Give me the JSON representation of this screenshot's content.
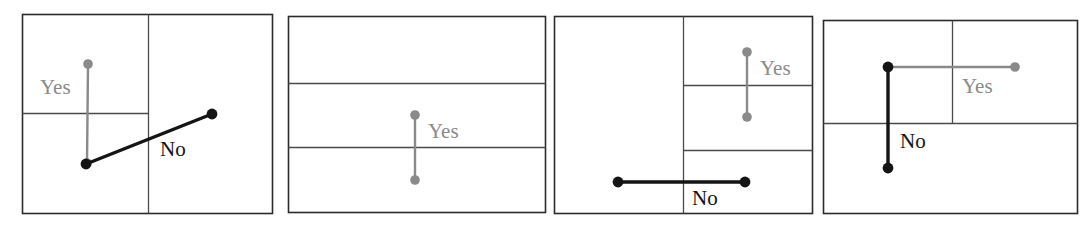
{
  "figure": {
    "width": 1084,
    "height": 235,
    "background_color": "#ffffff",
    "colors": {
      "panel_border": "#2b2b2b",
      "divider": "#4a4a4a",
      "yes_segment": "#8a8a8a",
      "no_segment": "#141414",
      "label_yes_text": "#8a8a8a",
      "label_no_text": "#141414"
    },
    "panels": [
      {
        "id": "panel-1",
        "index": 1,
        "frame": {
          "x": 22,
          "y": 14,
          "width": 250,
          "height": 199
        },
        "dividers": [
          {
            "orientation": "vertical",
            "x": 148,
            "y1": 14,
            "y2": 213
          },
          {
            "orientation": "horizontal",
            "y": 113,
            "x1": 22,
            "x2": 148
          }
        ],
        "segments": [
          {
            "name": "yes-segment",
            "label": "Yes",
            "color": "#8a8a8a",
            "start": {
              "x": 88,
              "y": 64,
              "endpoint": "dot"
            },
            "end": {
              "x": 87,
              "y": 163,
              "endpoint": "dot"
            },
            "label_position": {
              "x": 40,
              "y": 89
            }
          },
          {
            "name": "no-segment",
            "label": "No",
            "color": "#141414",
            "start": {
              "x": 86,
              "y": 164,
              "endpoint": "dot"
            },
            "end": {
              "x": 212,
              "y": 114,
              "endpoint": "dot"
            },
            "label_position": {
              "x": 160,
              "y": 151
            }
          }
        ]
      },
      {
        "id": "panel-2",
        "index": 2,
        "frame": {
          "x": 288,
          "y": 16,
          "width": 257,
          "height": 196
        },
        "dividers": [
          {
            "orientation": "horizontal",
            "y": 83,
            "x1": 288,
            "x2": 545
          },
          {
            "orientation": "horizontal",
            "y": 147,
            "x1": 288,
            "x2": 545
          }
        ],
        "segments": [
          {
            "name": "yes-segment",
            "label": "Yes",
            "color": "#8a8a8a",
            "start": {
              "x": 415,
              "y": 115,
              "endpoint": "dot"
            },
            "end": {
              "x": 415,
              "y": 180,
              "endpoint": "dot"
            },
            "label_position": {
              "x": 428,
              "y": 133
            }
          }
        ]
      },
      {
        "id": "panel-3",
        "index": 3,
        "frame": {
          "x": 554,
          "y": 16,
          "width": 258,
          "height": 197
        },
        "dividers": [
          {
            "orientation": "vertical",
            "x": 683,
            "y1": 16,
            "y2": 213
          },
          {
            "orientation": "horizontal",
            "y": 85,
            "x1": 683,
            "x2": 812
          },
          {
            "orientation": "horizontal",
            "y": 150,
            "x1": 683,
            "x2": 812
          }
        ],
        "segments": [
          {
            "name": "yes-segment",
            "label": "Yes",
            "color": "#8a8a8a",
            "start": {
              "x": 747,
              "y": 52,
              "endpoint": "dot"
            },
            "end": {
              "x": 747,
              "y": 117,
              "endpoint": "dot"
            },
            "label_position": {
              "x": 760,
              "y": 70
            }
          },
          {
            "name": "no-segment",
            "label": "No",
            "color": "#141414",
            "start": {
              "x": 618,
              "y": 182,
              "endpoint": "dot"
            },
            "end": {
              "x": 745,
              "y": 182,
              "endpoint": "dot"
            },
            "label_position": {
              "x": 692,
              "y": 200
            }
          }
        ]
      },
      {
        "id": "panel-4",
        "index": 4,
        "frame": {
          "x": 823,
          "y": 20,
          "width": 254,
          "height": 193
        },
        "dividers": [
          {
            "orientation": "vertical",
            "x": 952,
            "y1": 20,
            "y2": 123
          },
          {
            "orientation": "horizontal",
            "y": 123,
            "x1": 823,
            "x2": 1077
          }
        ],
        "segments": [
          {
            "name": "yes-segment",
            "label": "Yes",
            "color": "#8a8a8a",
            "start": {
              "x": 888,
              "y": 67,
              "endpoint": "dot"
            },
            "end": {
              "x": 1015,
              "y": 67,
              "endpoint": "dot"
            },
            "label_position": {
              "x": 962,
              "y": 88
            }
          },
          {
            "name": "no-segment",
            "label": "No",
            "color": "#141414",
            "start": {
              "x": 888,
              "y": 67,
              "endpoint": "dot"
            },
            "end": {
              "x": 888,
              "y": 168,
              "endpoint": "dot"
            },
            "label_position": {
              "x": 900,
              "y": 143
            }
          }
        ]
      }
    ]
  }
}
